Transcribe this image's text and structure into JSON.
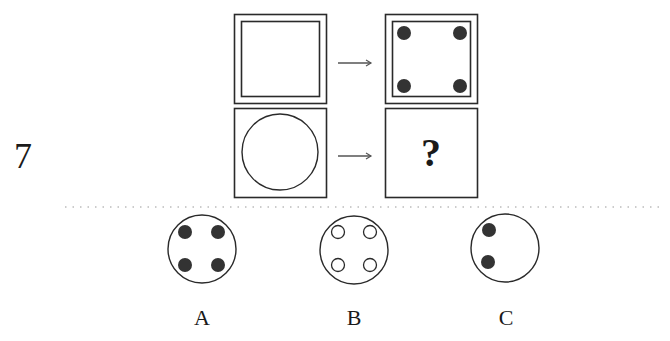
{
  "question": {
    "number": "7",
    "missing_marker": "?"
  },
  "puzzle": {
    "row1": {
      "left": "square-in-square",
      "arrow": "arrow-right",
      "right": "square-in-square-with-four-filled-dots"
    },
    "row2": {
      "left": "circle-in-square",
      "arrow": "arrow-right",
      "right": "unknown"
    }
  },
  "options": [
    {
      "label": "A",
      "figure": "circle-with-four-filled-dots"
    },
    {
      "label": "B",
      "figure": "circle-with-four-hollow-dots"
    },
    {
      "label": "C",
      "figure": "circle-with-two-filled-dots-left"
    }
  ],
  "colors": {
    "stroke": "#2a2a2a",
    "dot_fill": "#333333",
    "divider": "#9a9a9a"
  }
}
